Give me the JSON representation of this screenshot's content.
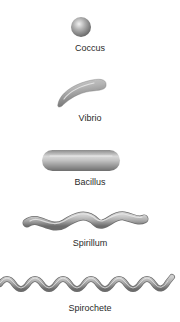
{
  "diagram": {
    "items": [
      {
        "label": "Coccus",
        "shape": "sphere"
      },
      {
        "label": "Vibrio",
        "shape": "curved-rod"
      },
      {
        "label": "Bacillus",
        "shape": "rod"
      },
      {
        "label": "Spirillum",
        "shape": "rigid-spiral"
      },
      {
        "label": "Spirochete",
        "shape": "flexible-spiral"
      }
    ],
    "colors": {
      "body_light": "#e6e6e6",
      "body_mid": "#a8a8a8",
      "body_dark": "#6e6e6e",
      "label": "#2a2a2a",
      "background": "#ffffff"
    }
  }
}
